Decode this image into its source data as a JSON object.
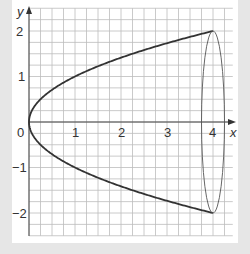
{
  "chart_data": {
    "type": "line",
    "title": "",
    "xlabel": "x",
    "ylabel": "y",
    "xlim": [
      0,
      4.43
    ],
    "ylim": [
      -2.5,
      2.5
    ],
    "grid": true,
    "grid_step": 0.25,
    "x_ticks": [
      "0",
      "1",
      "2",
      "3",
      "4"
    ],
    "y_ticks": [
      "2",
      "1",
      "0",
      "-1",
      "-2"
    ],
    "series": [
      {
        "name": "upper branch y = √x",
        "x": [
          0,
          0.25,
          0.5,
          1,
          1.5,
          2,
          2.5,
          3,
          3.5,
          4
        ],
        "y": [
          0,
          0.5,
          0.707,
          1,
          1.225,
          1.414,
          1.581,
          1.732,
          1.871,
          2
        ]
      },
      {
        "name": "lower branch y = -√x",
        "x": [
          0,
          0.25,
          0.5,
          1,
          1.5,
          2,
          2.5,
          3,
          3.5,
          4
        ],
        "y": [
          0,
          -0.5,
          -0.707,
          -1,
          -1.225,
          -1.414,
          -1.581,
          -1.732,
          -1.871,
          -2
        ]
      },
      {
        "name": "ellipse at x = 4 (cross-section)",
        "center": [
          4,
          0
        ],
        "rx": 0.25,
        "ry": 2
      }
    ],
    "colors": {
      "curve": "#333333",
      "grid": "#bbbbbb",
      "axis": "#444444",
      "background": "#e6e6e6",
      "panel": "#ffffff"
    }
  },
  "labels": {
    "x_axis": "x",
    "y_axis": "y",
    "x_tick_0": "0",
    "x_tick_1": "1",
    "x_tick_2": "2",
    "x_tick_3": "3",
    "x_tick_4": "4",
    "y_tick_2": "2",
    "y_tick_1": "1",
    "y_tick_m1": "−1",
    "y_tick_m2": "−2"
  }
}
